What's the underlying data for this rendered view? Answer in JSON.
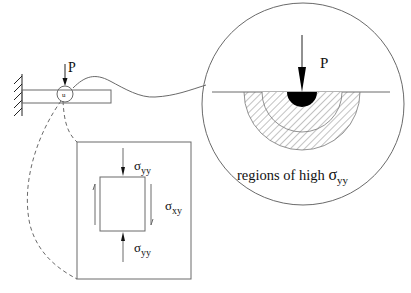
{
  "beam": {
    "load_label": "P",
    "zoom_marker_label": "u"
  },
  "detail_view": {
    "load_label": "P",
    "caption_prefix": "regions of high ",
    "caption_symbol": "σ",
    "caption_subscript": "yy",
    "regions": [
      "contact zone",
      "inner high-stress region",
      "outer high-stress region"
    ]
  },
  "stress_element": {
    "top_label_symbol": "σ",
    "top_label_subscript": "yy",
    "shear_label_symbol": "σ",
    "shear_label_subscript": "xy",
    "bottom_label_symbol": "σ",
    "bottom_label_subscript": "yy"
  }
}
